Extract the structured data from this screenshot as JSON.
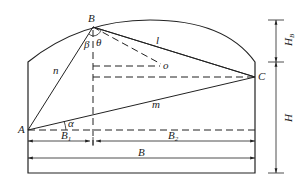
{
  "diagram": {
    "type": "geometry-schematic",
    "points": {
      "A": "A",
      "B": "B",
      "C": "C",
      "o": "o"
    },
    "segments": {
      "n": "n",
      "l": "l",
      "m": "m"
    },
    "angles": {
      "alpha": "α",
      "beta": "β",
      "theta": "θ"
    },
    "dimensions": {
      "B1": {
        "main": "B",
        "sub": "1"
      },
      "B2": {
        "main": "B",
        "sub": "2"
      },
      "B": "B",
      "HB": {
        "main": "H",
        "sub": "B"
      },
      "H": "H"
    },
    "colors": {
      "line": "#222222",
      "background": "#ffffff"
    }
  }
}
